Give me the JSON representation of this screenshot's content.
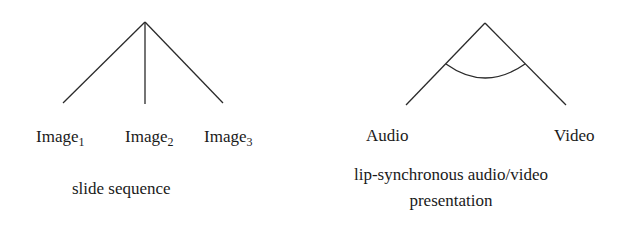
{
  "diagrams": [
    {
      "name": "slide-sequence",
      "leaves": [
        {
          "base": "Image",
          "sub": "1"
        },
        {
          "base": "Image",
          "sub": "2"
        },
        {
          "base": "Image",
          "sub": "3"
        }
      ],
      "caption": "slide sequence"
    },
    {
      "name": "lip-sync-presentation",
      "leaves": [
        {
          "base": "Audio"
        },
        {
          "base": "Video"
        }
      ],
      "caption_line1": "lip-synchronous audio/video",
      "caption_line2": "presentation"
    }
  ],
  "colors": {
    "line": "#2a2a2a",
    "text": "#1a1a1a",
    "background": "#ffffff"
  }
}
